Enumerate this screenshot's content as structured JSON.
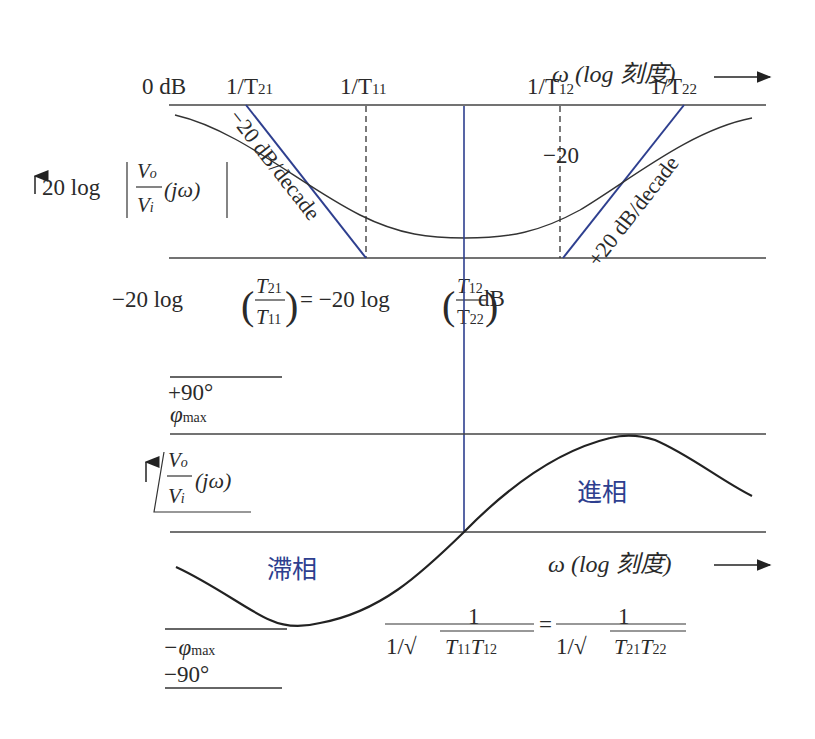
{
  "magnitude_plot": {
    "axis_label": "ω (log 刻度)",
    "y_label_prefix": "20 log",
    "y_label_frac_num": "V",
    "y_label_frac_num_sub": "o",
    "y_label_frac_den": "V",
    "y_label_frac_den_sub": "i",
    "y_label_suffix": "(jω)",
    "zero_db_label": "0 dB",
    "corner_labels": [
      {
        "text": "1/T",
        "sub": "21"
      },
      {
        "text": "1/T",
        "sub": "11"
      },
      {
        "text": "1/T",
        "sub": "12"
      },
      {
        "text": "1/T",
        "sub": "22"
      }
    ],
    "minus20_label": "−20",
    "slope_down_label": "−20 dB/decade",
    "slope_up_label": "+20 dB/decade",
    "floor_eq": {
      "left": "−20 log",
      "frac1_num": "T",
      "frac1_num_sub": "21",
      "frac1_den": "T",
      "frac1_den_sub": "11",
      "equals": "= −20 log",
      "frac2_num": "T",
      "frac2_num_sub": "12",
      "frac2_den": "T",
      "frac2_den_sub": "22",
      "unit": "dB"
    }
  },
  "phase_plot": {
    "axis_label": "ω (log 刻度)",
    "plus90": "+90°",
    "phi_max": "φ",
    "phi_max_sub": "max",
    "minus_phi_max": "−φ",
    "minus_phi_max_sub": "max",
    "minus90": "−90°",
    "y_label_frac_num": "V",
    "y_label_frac_num_sub": "o",
    "y_label_frac_den": "V",
    "y_label_frac_den_sub": "i",
    "y_label_suffix": "(jω)",
    "lead_label": "進相",
    "lag_label": "滯相",
    "center_eq": {
      "num_left": "1",
      "den_left": "1/√",
      "den_left_terms": [
        {
          "t": "T",
          "sub": "11"
        },
        {
          "t": "T",
          "sub": "12"
        }
      ],
      "equals": "=",
      "num_right": "1",
      "den_right": "1/√",
      "den_right_terms": [
        {
          "t": "T",
          "sub": "21"
        },
        {
          "t": "T",
          "sub": "22"
        }
      ]
    }
  },
  "colors": {
    "line": "#333333",
    "asymptote_blue": "#2e3f8f",
    "label_blue": "#3a4a90"
  }
}
